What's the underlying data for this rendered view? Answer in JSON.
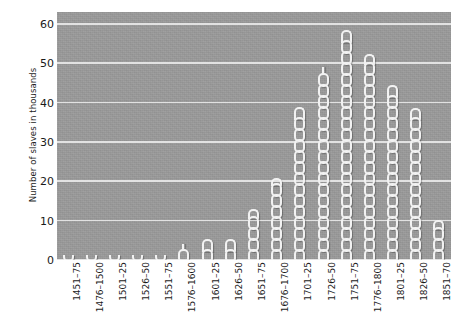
{
  "chart_data": {
    "type": "bar",
    "title": "",
    "subtitle": "",
    "xlabel": "",
    "ylabel": "Number of slaves in thousands",
    "ylim": [
      0,
      63
    ],
    "yticks": [
      0,
      10,
      20,
      30,
      40,
      50,
      60
    ],
    "grid": true,
    "legend": false,
    "legend_position": "none",
    "bar_style": "chain-links",
    "categories": [
      "1451–75",
      "1476–1500",
      "1501–25",
      "1526–50",
      "1551–75",
      "1576–1600",
      "1601–25",
      "1626–50",
      "1651–75",
      "1676–1700",
      "1701–25",
      "1726–50",
      "1751–75",
      "1776–1800",
      "1801–25",
      "1826–50",
      "1851–70"
    ],
    "values": [
      1,
      1,
      2,
      2,
      2,
      4,
      7,
      7,
      14,
      22,
      41,
      50,
      61,
      54,
      47,
      40,
      11
    ],
    "annotations": []
  },
  "style": {
    "plot_background": "#9a9a9a",
    "gridline_color": "#e8e8e8",
    "bar_color": "#f2f2f2",
    "page_background": "#ffffff",
    "text_color": "#1a1a1a"
  }
}
